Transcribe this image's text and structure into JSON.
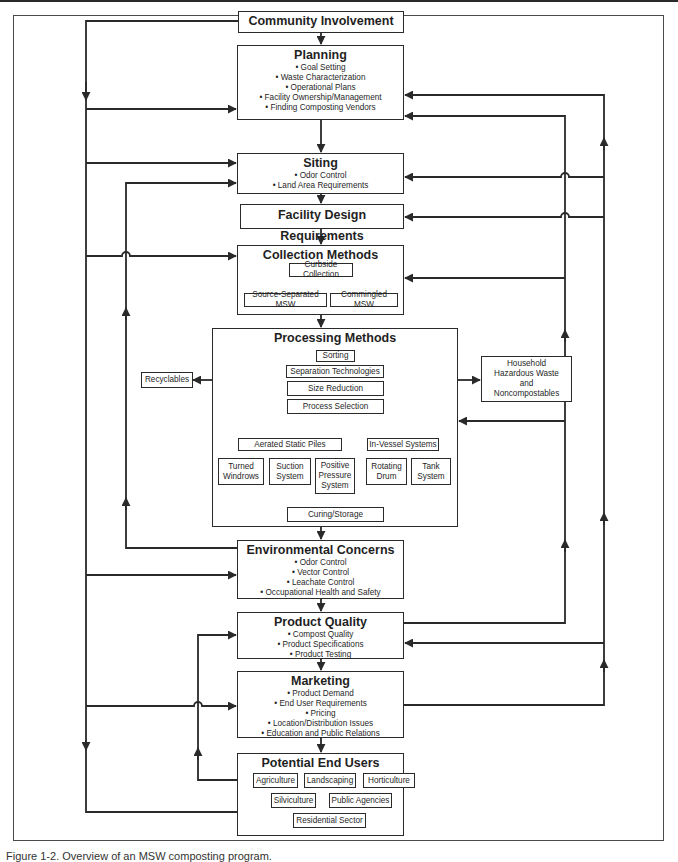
{
  "diagram": {
    "community": {
      "title": "Community Involvement"
    },
    "planning": {
      "title": "Planning",
      "items": [
        "• Goal Setting",
        "• Waste Characterization",
        "• Operational Plans",
        "• Facility Ownership/Management",
        "• Finding Composting Vendors"
      ]
    },
    "siting": {
      "title": "Siting",
      "items": [
        "• Odor Control",
        "• Land Area Requirements"
      ]
    },
    "facility_design": {
      "title": "Facility Design Requirements"
    },
    "collection": {
      "title": "Collection Methods",
      "curbside": "Curbside Collection",
      "source_separated": "Source-Separated MSW",
      "commingled": "Commingled MSW"
    },
    "processing": {
      "title": "Processing Methods",
      "steps": [
        "Sorting",
        "Separation Technologies",
        "Size Reduction",
        "Process Selection"
      ],
      "aerated": "Aerated Static Piles",
      "in_vessel": "In-Vessel Systems",
      "methods": [
        "Turned Windrows",
        "Suction System",
        "Positive Pressure System",
        "Rotating Drum",
        "Tank System"
      ],
      "curing": "Curing/Storage"
    },
    "recyclables": "Recyclables",
    "household": [
      "Household",
      "Hazardous Waste",
      "and",
      "Noncompostables"
    ],
    "environmental": {
      "title": "Environmental Concerns",
      "items": [
        "• Odor Control",
        "• Vector Control",
        "• Leachate Control",
        "• Occupational Health and Safety"
      ]
    },
    "product_quality": {
      "title": "Product Quality",
      "items": [
        "• Compost Quality",
        "• Product Specifications",
        "• Product Testing"
      ]
    },
    "marketing": {
      "title": "Marketing",
      "items": [
        "• Product Demand",
        "• End User Requirements",
        "• Pricing",
        "• Location/Distribution Issues",
        "• Education and Public Relations"
      ]
    },
    "end_users": {
      "title": "Potential End Users",
      "items": [
        "Agriculture",
        "Landscaping",
        "Horticulture",
        "Silviculture",
        "Public Agencies",
        "Residential Sector"
      ]
    }
  },
  "caption": "Figure 1-2.   Overview of an MSW composting program.",
  "colors": {
    "line": "#2a2a2a",
    "background": "#ffffff"
  }
}
